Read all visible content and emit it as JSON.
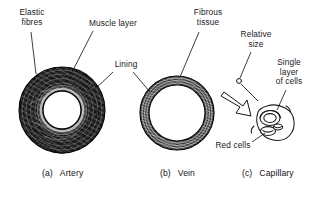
{
  "figure": {
    "kind": "scientific-illustration",
    "background_color": "#ffffff",
    "ink_color": "#111111"
  },
  "labels": [
    {
      "id": "elastic-fibres",
      "text": "Elastic\nfibres",
      "x": 8,
      "y": 8,
      "w": 48
    },
    {
      "id": "muscle-layer",
      "text": "Muscle layer",
      "x": 78,
      "y": 19,
      "w": 70
    },
    {
      "id": "lining",
      "text": "Lining",
      "x": 108,
      "y": 60,
      "w": 36
    },
    {
      "id": "fibrous-tissue",
      "text": "Fibrous\ntissue",
      "x": 184,
      "y": 8,
      "w": 48
    },
    {
      "id": "relative-size",
      "text": "Relative\nsize",
      "x": 233,
      "y": 30,
      "w": 46
    },
    {
      "id": "single-layer",
      "text": "Single\nlayer\nof cells",
      "x": 265,
      "y": 58,
      "w": 48
    },
    {
      "id": "red-cells",
      "text": "Red cells",
      "x": 208,
      "y": 141,
      "w": 50
    }
  ],
  "captions": [
    {
      "id": "artery",
      "tag": "(a)",
      "name": "Artery",
      "x": 42,
      "y": 168
    },
    {
      "id": "vein",
      "tag": "(b)",
      "name": "Vein",
      "x": 160,
      "y": 168
    },
    {
      "id": "capillary",
      "tag": "(c)",
      "name": "Capillary",
      "x": 242,
      "y": 168
    }
  ],
  "vessels": [
    {
      "id": "artery",
      "cx": 62,
      "cy": 110,
      "outer_r": 43,
      "lumen_r": 19
    },
    {
      "id": "vein",
      "cx": 177,
      "cy": 113,
      "outer_r": 37,
      "lumen_r": 28
    },
    {
      "id": "capillary",
      "cx": 271,
      "cy": 122,
      "outer_r": 15,
      "lumen_r": 7
    }
  ]
}
